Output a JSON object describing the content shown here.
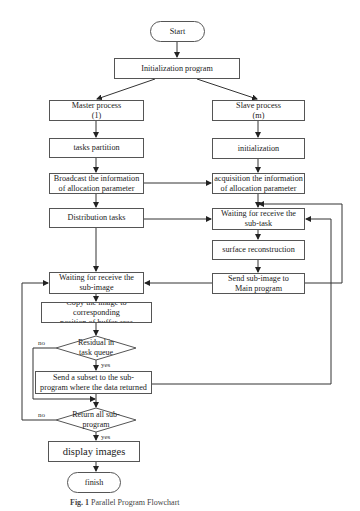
{
  "diagram": {
    "nodes": {
      "start": "Start",
      "init_program": "Initialization program",
      "master_process": "Master process\n(1)",
      "slave_process": "Slave process\n(m)",
      "tasks_partition": "tasks partition",
      "slave_initialization": "initialization",
      "broadcast": "Broadcast the information\nof allocation parameter",
      "acquisition": "acquisition the information\nof allocation parameter",
      "distribution": "Distribution tasks",
      "wait_subtask": "Waiting for receive the\nsub-task",
      "surface_reconstruction": "surface reconstruction",
      "send_subimage": "Send sub-image to\nMain program",
      "wait_subimage": "Waiting for receive the\nsub-image",
      "copy_image": "Copy the image to corresponding\nposition of buffer area",
      "decision_residual": "Residual in\ntask queue",
      "send_subset": "Send a subset to the sub-\nprogram where the data returned",
      "decision_return_all": "Return all sub-\nprogram",
      "display_images": "display images",
      "finish": "finish"
    },
    "edge_labels": {
      "residual_no": "no",
      "residual_yes": "yes",
      "return_all_no": "no",
      "return_all_yes": "yes"
    },
    "caption": {
      "fig": "Fig. 1",
      "text": "Parallel Program Flowchart"
    }
  }
}
